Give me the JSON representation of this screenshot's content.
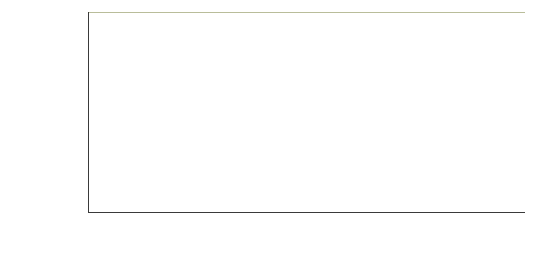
{
  "chart_data": {
    "type": "bar",
    "title": "",
    "xlabel": "",
    "ylabel": "Percent of adults who use the\nInternet at home",
    "ylim": [
      0,
      110
    ],
    "yticks": [
      0,
      20,
      40,
      60,
      80,
      100
    ],
    "grid": true,
    "legend": "none",
    "bar_color": "#7c8a4d",
    "groups": [
      {
        "name": "Gender",
        "categories": [
          "Men",
          "Women"
        ],
        "values": [
          78,
          78
        ]
      },
      {
        "name": "Age",
        "categories": [
          "18 to 29",
          "30 to 49",
          "50 to 64",
          "65 and Older"
        ],
        "values": [
          95,
          87,
          74,
          42
        ]
      },
      {
        "name": "Ethnicity",
        "categories": [
          "Non-Hispanic White",
          "Non-Hispanic Black",
          "English-Speaking Hispanic"
        ],
        "values": [
          79,
          67,
          78
        ]
      },
      {
        "name": "Education",
        "categories": [
          "Less than\nHigh School",
          "High School Graduate",
          "Some College",
          "Bachelor's Degree or Higher"
        ],
        "values": [
          42,
          69,
          89,
          94
        ]
      },
      {
        "name": "Household\nIncome",
        "categories": [
          "Less than $30,000",
          "$30,000–$49,999",
          "$50,000–$74,999",
          "$75,000 or more"
        ],
        "values": [
          63,
          85,
          89,
          96
        ]
      }
    ]
  },
  "axis": {
    "ytick_labels": [
      "0",
      "20",
      "40",
      "60",
      "80",
      "100"
    ]
  }
}
